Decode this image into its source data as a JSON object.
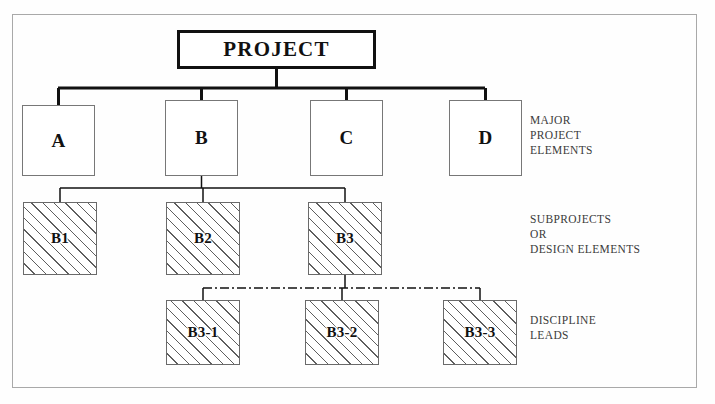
{
  "diagram": {
    "frame": {
      "border_color": "#a9a9a9",
      "background": "#fefefe"
    },
    "colors": {
      "node_border": "#777777",
      "root_border": "#111111",
      "hatch_line": "#5e5e5e",
      "connector": "#111111",
      "label_text": "#3b3b3b"
    },
    "root": {
      "id": "project",
      "label": "PROJECT",
      "x": 177,
      "y": 30,
      "w": 199,
      "h": 39,
      "style": "thick-border"
    },
    "levels": [
      {
        "id": "major-project-elements",
        "side_label": "MAJOR\nPROJECT\nELEMENTS",
        "side_label_x": 530,
        "side_label_y": 113,
        "nodes": [
          {
            "id": "a",
            "label": "A",
            "x": 22,
            "y": 105,
            "w": 73,
            "h": 71,
            "style": "plain"
          },
          {
            "id": "b",
            "label": "B",
            "x": 165,
            "y": 100,
            "w": 73,
            "h": 76,
            "style": "plain"
          },
          {
            "id": "c",
            "label": "C",
            "x": 310,
            "y": 100,
            "w": 73,
            "h": 76,
            "style": "plain"
          },
          {
            "id": "d",
            "label": "D",
            "x": 449,
            "y": 100,
            "w": 73,
            "h": 76,
            "style": "plain"
          }
        ]
      },
      {
        "id": "subprojects-or-design-elements",
        "side_label": "SUBPROJECTS\nOR\nDESIGN ELEMENTS",
        "side_label_x": 530,
        "side_label_y": 212,
        "nodes": [
          {
            "id": "b1",
            "label": "B1",
            "x": 23,
            "y": 202,
            "w": 74,
            "h": 73,
            "style": "hatched"
          },
          {
            "id": "b2",
            "label": "B2",
            "x": 166,
            "y": 202,
            "w": 74,
            "h": 73,
            "style": "hatched"
          },
          {
            "id": "b3",
            "label": "B3",
            "x": 308,
            "y": 202,
            "w": 74,
            "h": 73,
            "style": "hatched"
          }
        ]
      },
      {
        "id": "discipline-leads",
        "side_label": "DISCIPLINE\nLEADS",
        "side_label_x": 530,
        "side_label_y": 313,
        "nodes": [
          {
            "id": "b3-1",
            "label": "B3-1",
            "x": 166,
            "y": 300,
            "w": 74,
            "h": 65,
            "style": "hatched"
          },
          {
            "id": "b3-2",
            "label": "B3-2",
            "x": 305,
            "y": 300,
            "w": 74,
            "h": 65,
            "style": "hatched"
          },
          {
            "id": "b3-3",
            "label": "B3-3",
            "x": 443,
            "y": 300,
            "w": 74,
            "h": 65,
            "style": "hatched"
          }
        ]
      }
    ],
    "connectors": [
      {
        "id": "root-drop",
        "type": "solid",
        "width": 3,
        "points": "276.5,69 276.5,88"
      },
      {
        "id": "level1-bus",
        "type": "solid",
        "width": 3,
        "points": "58,88 485,88"
      },
      {
        "id": "drop-to-a",
        "type": "solid",
        "width": 3,
        "points": "58.5,88 58.5,105"
      },
      {
        "id": "drop-to-b",
        "type": "solid",
        "width": 3,
        "points": "201.5,88 201.5,100"
      },
      {
        "id": "drop-to-c",
        "type": "solid",
        "width": 3,
        "points": "346.5,88 346.5,100"
      },
      {
        "id": "drop-to-d",
        "type": "solid",
        "width": 3,
        "points": "485.5,88 485.5,100"
      },
      {
        "id": "b-drop",
        "type": "solid",
        "width": 1.5,
        "points": "201.5,176 201.5,188"
      },
      {
        "id": "level2-bus",
        "type": "solid",
        "width": 1.5,
        "points": "60,188 345,188"
      },
      {
        "id": "drop-to-b1",
        "type": "solid",
        "width": 1.5,
        "points": "60,188 60,202"
      },
      {
        "id": "drop-to-b2",
        "type": "solid",
        "width": 1.5,
        "points": "203,188 203,202"
      },
      {
        "id": "drop-to-b3",
        "type": "solid",
        "width": 1.5,
        "points": "345,188 345,202"
      },
      {
        "id": "b3-drop",
        "type": "solid",
        "width": 1.5,
        "points": "345,275 345,288"
      },
      {
        "id": "level3-bus",
        "type": "dash-dot",
        "width": 1.5,
        "points": "203,288 480,288"
      },
      {
        "id": "drop-to-b3-1",
        "type": "solid",
        "width": 1.5,
        "points": "203,288 203,300"
      },
      {
        "id": "drop-to-b3-2",
        "type": "solid",
        "width": 1.5,
        "points": "342,288 342,300"
      },
      {
        "id": "drop-to-b3-3",
        "type": "solid",
        "width": 1.5,
        "points": "480,288 480,300"
      }
    ]
  }
}
